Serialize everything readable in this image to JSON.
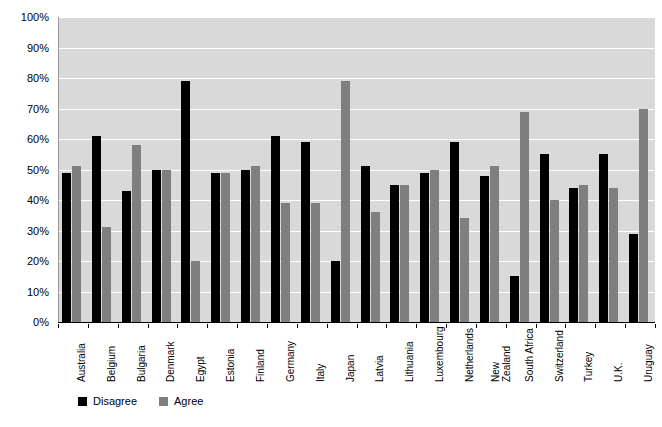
{
  "chart_data": {
    "type": "bar",
    "title": "",
    "subtitle": "",
    "xlabel": "",
    "ylabel": "",
    "ylim": [
      0,
      100
    ],
    "y_tick_labels": [
      "100%",
      "90%",
      "80%",
      "70%",
      "60%",
      "50%",
      "40%",
      "30%",
      "20%",
      "10%",
      "0%"
    ],
    "y_tick_values": [
      100,
      90,
      80,
      70,
      60,
      50,
      40,
      30,
      20,
      10,
      0
    ],
    "grid": "horizontal",
    "legend_position": "bottom-left",
    "categories": [
      "Australia",
      "Belgium",
      "Bulgaria",
      "Denmark",
      "Egypt",
      "Estonia",
      "Finland",
      "Germany",
      "Italy",
      "Japan",
      "Latvia",
      "Lithuania",
      "Luxembourg",
      "Netherlands",
      "New\nZealand",
      "South Africa",
      "Switzerland",
      "Turkey",
      "U.K.",
      "Uruguay"
    ],
    "series": [
      {
        "name": "Disagree",
        "color": "#000000",
        "values": [
          49,
          61,
          43,
          50,
          79,
          49,
          50,
          61,
          59,
          20,
          51,
          45,
          49,
          59,
          48,
          15,
          55,
          44,
          55,
          29
        ]
      },
      {
        "name": "Agree",
        "color": "#7f7f7f",
        "values": [
          51,
          31,
          58,
          50,
          20,
          49,
          51,
          39,
          39,
          79,
          36,
          45,
          50,
          34,
          51,
          69,
          40,
          45,
          44,
          70
        ]
      }
    ],
    "plot_background": "#d9d9d9",
    "gridline_color": "#ffffff",
    "axis_color": "#000000"
  }
}
